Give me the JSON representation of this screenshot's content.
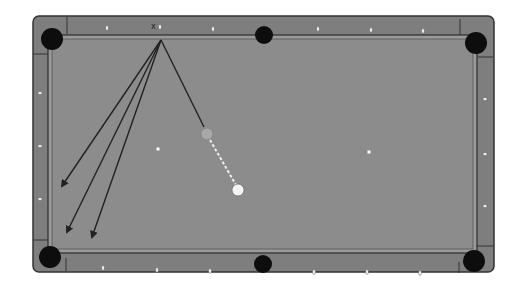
{
  "diagram": {
    "type": "pool-table-shot-diagram",
    "colors": {
      "background": "#ffffff",
      "rail": "#7e7e7e",
      "rail_border": "#333333",
      "cloth": "#8c8c8c",
      "cushion": "#9a9a9a",
      "pocket": "#0d0d0d",
      "diamond": "#f2f2f2",
      "line": "#222222",
      "cue_ball": "#f4f4f4",
      "object_ball": "#a8a8a8",
      "dashed_path": "#eeeeee"
    },
    "table": {
      "x": 33,
      "y": 16,
      "width": 461,
      "height": 256
    },
    "pockets": [
      {
        "name": "top-left-pocket",
        "cx": 52,
        "cy": 39,
        "r": 11
      },
      {
        "name": "top-middle-pocket",
        "cx": 264,
        "cy": 35,
        "r": 9
      },
      {
        "name": "top-right-pocket",
        "cx": 476,
        "cy": 43,
        "r": 11
      },
      {
        "name": "bottom-left-pocket",
        "cx": 50,
        "cy": 257,
        "r": 11
      },
      {
        "name": "bottom-middle-pocket",
        "cx": 263,
        "cy": 264,
        "r": 9
      },
      {
        "name": "bottom-right-pocket",
        "cx": 474,
        "cy": 261,
        "r": 11
      }
    ],
    "diamonds": {
      "top": [
        [
          107,
          28
        ],
        [
          160,
          27
        ],
        [
          213,
          29
        ],
        [
          318,
          29
        ],
        [
          371,
          30
        ],
        [
          423,
          31
        ]
      ],
      "bottom": [
        [
          103,
          268
        ],
        [
          157,
          270
        ],
        [
          210,
          271
        ],
        [
          314,
          272
        ],
        [
          367,
          272
        ],
        [
          420,
          273
        ]
      ],
      "left": [
        [
          40,
          93
        ],
        [
          40,
          146
        ],
        [
          40,
          199
        ]
      ],
      "right": [
        [
          485,
          99
        ],
        [
          485,
          154
        ],
        [
          485,
          206
        ]
      ]
    },
    "spots": [
      {
        "name": "head-spot",
        "cx": 158,
        "cy": 149
      },
      {
        "name": "foot-spot",
        "cx": 369,
        "cy": 152
      }
    ],
    "label_x": {
      "text": "x",
      "x": 153,
      "y": 31
    },
    "aim_point": {
      "x": 161,
      "y": 40
    },
    "object_ball": {
      "cx": 207,
      "cy": 134,
      "r": 6
    },
    "cue_ball": {
      "cx": 238,
      "cy": 190,
      "r": 6
    },
    "lines": [
      {
        "name": "line-to-object-ball",
        "x1": 161,
        "y1": 40,
        "x2": 204,
        "y2": 127,
        "arrow": false
      },
      {
        "name": "arrow-line-1",
        "x1": 161,
        "y1": 40,
        "x2": 62,
        "y2": 186,
        "arrow": true
      },
      {
        "name": "arrow-line-2",
        "x1": 161,
        "y1": 40,
        "x2": 67,
        "y2": 232,
        "arrow": true
      },
      {
        "name": "arrow-line-3",
        "x1": 161,
        "y1": 40,
        "x2": 92,
        "y2": 237,
        "arrow": true
      }
    ],
    "dashed_path": {
      "x1": 210,
      "y1": 140,
      "x2": 236,
      "y2": 185
    }
  }
}
